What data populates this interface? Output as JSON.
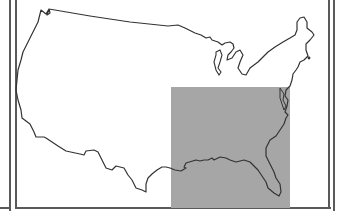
{
  "map": {
    "subject": "Contiguous United States outline",
    "highlight_region": "Southeastern United States",
    "colors": {
      "background": "#ffffff",
      "outline": "#333333",
      "highlight_fill": "#a6a6a6",
      "frame": "#5a5a5a"
    }
  }
}
